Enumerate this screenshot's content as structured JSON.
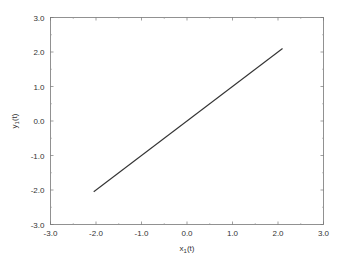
{
  "chart_data": {
    "type": "line",
    "title": "",
    "xlabel": "x1(t)",
    "ylabel": "y1(t)",
    "xlim": [
      -3.0,
      3.0
    ],
    "ylim": [
      -3.0,
      3.0
    ],
    "xticks": [
      "-3.0",
      "-2.0",
      "-1.0",
      "0.0",
      "1.0",
      "2.0",
      "3.0"
    ],
    "yticks": [
      "-3.0",
      "-2.0",
      "-1.0",
      "0.0",
      "1.0",
      "2.0",
      "3.0"
    ],
    "grid": false,
    "legend": null,
    "series": [
      {
        "name": "trajectory",
        "color": "#333333",
        "x": [
          -2.05,
          2.1
        ],
        "y": [
          -2.05,
          2.1
        ]
      }
    ]
  },
  "axes": {
    "x_label_main": "x",
    "x_label_sub": "1",
    "x_label_tail": "(t)",
    "y_label_main": "y",
    "y_label_sub": "1",
    "y_label_tail": "(t)"
  }
}
